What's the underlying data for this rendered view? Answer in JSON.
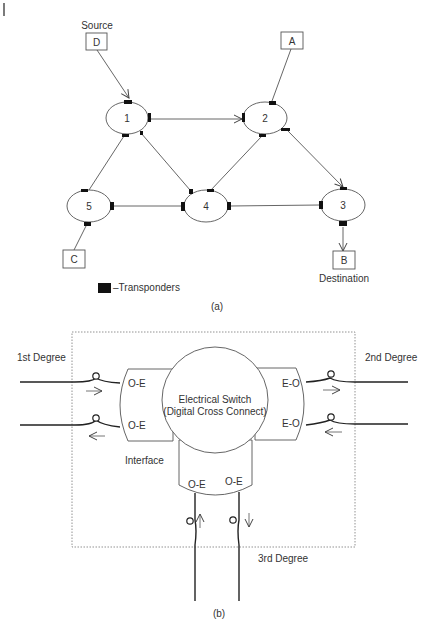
{
  "figure_a": {
    "caption": "(a)",
    "source_label": "Source",
    "destination_label": "Destination",
    "legend_label": "–Transponders",
    "terminals": [
      {
        "id": "D",
        "label": "D"
      },
      {
        "id": "A",
        "label": "A"
      },
      {
        "id": "C",
        "label": "C"
      },
      {
        "id": "B",
        "label": "B"
      }
    ],
    "nodes": [
      {
        "id": "1",
        "label": "1"
      },
      {
        "id": "2",
        "label": "2"
      },
      {
        "id": "3",
        "label": "3"
      },
      {
        "id": "4",
        "label": "4"
      },
      {
        "id": "5",
        "label": "5"
      }
    ],
    "edges": [
      {
        "from": "D",
        "to": "1",
        "directed": true
      },
      {
        "from": "A",
        "to": "2",
        "directed": false
      },
      {
        "from": "1",
        "to": "2",
        "directed": true
      },
      {
        "from": "1",
        "to": "5",
        "directed": false
      },
      {
        "from": "1",
        "to": "4",
        "directed": false
      },
      {
        "from": "2",
        "to": "4",
        "directed": false
      },
      {
        "from": "2",
        "to": "3",
        "directed": true
      },
      {
        "from": "5",
        "to": "4",
        "directed": false
      },
      {
        "from": "4",
        "to": "3",
        "directed": false
      },
      {
        "from": "5",
        "to": "C",
        "directed": false
      },
      {
        "from": "3",
        "to": "B",
        "directed": true
      }
    ]
  },
  "figure_b": {
    "caption": "(b)",
    "switch_line1": "Electrical Switch",
    "switch_line2": "(Digital Cross Connect)",
    "degree1_label": "1st Degree",
    "degree2_label": "2nd Degree",
    "degree3_label": "3rd Degree",
    "interface_label": "Interface",
    "left_ports": [
      "O-E",
      "O-E"
    ],
    "right_ports": [
      "E-O",
      "E-O"
    ],
    "bottom_ports": [
      "O-E",
      "O-E"
    ]
  }
}
